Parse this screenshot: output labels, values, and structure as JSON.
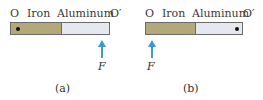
{
  "panels": [
    {
      "caption": "(a)",
      "label_o": "O",
      "label_iron": "Iron",
      "label_aluminum": "Aluminum",
      "label_o_prime": "O′",
      "pivot_side": "iron-end",
      "force_label": "F",
      "force_position": "aluminum-end"
    },
    {
      "caption": "(b)",
      "label_o": "O",
      "label_iron": "Iron",
      "label_aluminum": "Aluminum",
      "label_o_prime": "O′",
      "pivot_side": "aluminum-end",
      "force_label": "F",
      "force_position": "iron-end"
    }
  ],
  "colors": {
    "iron": "#b3a878",
    "aluminum": "#e6e8f0",
    "arrow": "#3b9ad0"
  }
}
